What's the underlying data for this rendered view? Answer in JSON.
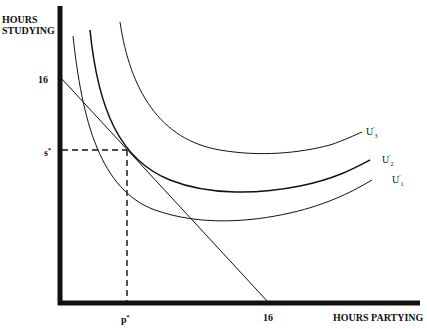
{
  "diagram": {
    "y_axis_label_line1": "HOURS",
    "y_axis_label_line2": "STUDYING",
    "x_axis_label": "HOURS PARTYING",
    "y_tick_16": "16",
    "y_tick_s": "s",
    "x_tick_p": "p",
    "x_tick_16": "16",
    "star": "*",
    "curves": [
      {
        "id": "U1",
        "base": "U",
        "sup": "'",
        "sub": "1"
      },
      {
        "id": "U2",
        "base": "U",
        "sup": "'",
        "sub": "2"
      },
      {
        "id": "U3",
        "base": "U",
        "sup": "'",
        "sub": "3"
      }
    ],
    "colors": {
      "ink": "#111111",
      "background": "#ffffff"
    }
  }
}
